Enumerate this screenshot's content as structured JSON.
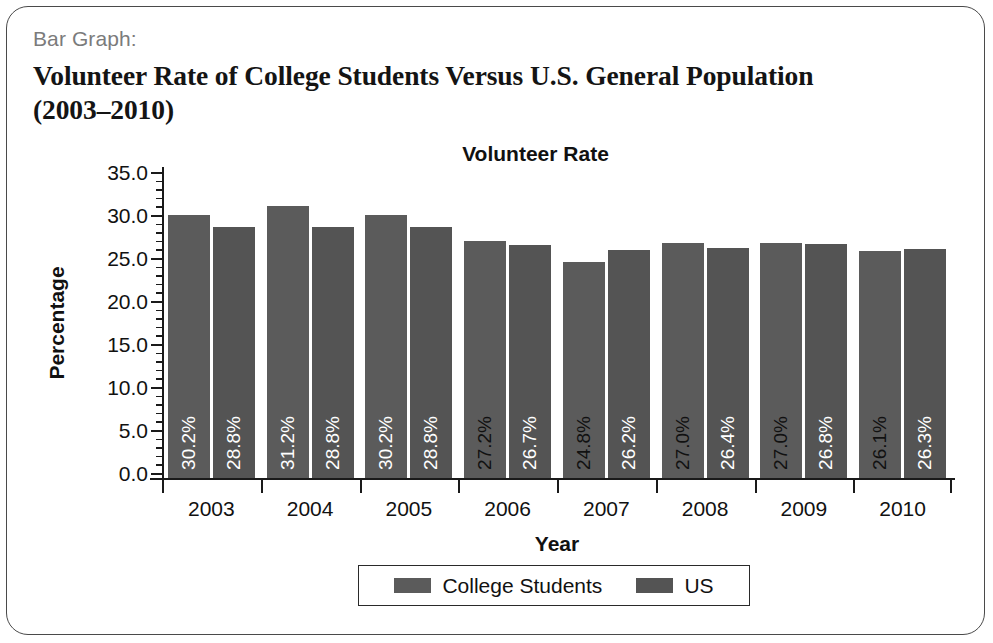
{
  "card": {
    "kicker": "Bar Graph:",
    "title": "Volunteer Rate of College Students Versus U.S. General Population (2003–2010)"
  },
  "chart_data": {
    "type": "bar",
    "title": "Volunteer Rate",
    "xlabel": "Year",
    "ylabel": "Percentage",
    "categories": [
      "2003",
      "2004",
      "2005",
      "2006",
      "2007",
      "2008",
      "2009",
      "2010"
    ],
    "series": [
      {
        "name": "College Students",
        "color": "#5b5b5b",
        "label_color": "#ffffff",
        "values": [
          30.2,
          31.2,
          30.2,
          27.2,
          24.8,
          27.0,
          27.0,
          26.1
        ],
        "labels": [
          "30.2%",
          "31.2%",
          "30.2%",
          "27.2%",
          "24.8%",
          "27.0%",
          "27.0%",
          "26.1%"
        ],
        "label_dark": [
          false,
          false,
          false,
          true,
          true,
          true,
          true,
          true
        ]
      },
      {
        "name": "US",
        "color": "#545454",
        "label_color": "#ffffff",
        "values": [
          28.8,
          28.8,
          28.8,
          26.7,
          26.2,
          26.4,
          26.8,
          26.3
        ],
        "labels": [
          "28.8%",
          "28.8%",
          "28.8%",
          "26.7%",
          "26.2%",
          "26.4%",
          "26.8%",
          "26.3%"
        ],
        "label_dark": [
          false,
          false,
          false,
          false,
          false,
          false,
          false,
          false
        ]
      }
    ],
    "ylim": [
      0.0,
      35.0
    ],
    "ytick_step": 5.0,
    "yminor_step": 1.0,
    "ytick_labels": [
      "0.0",
      "5.0",
      "10.0",
      "15.0",
      "20.0",
      "25.0",
      "30.0",
      "35.0"
    ],
    "grid": false,
    "legend_position": "bottom",
    "legend": [
      "College Students",
      "US"
    ]
  }
}
